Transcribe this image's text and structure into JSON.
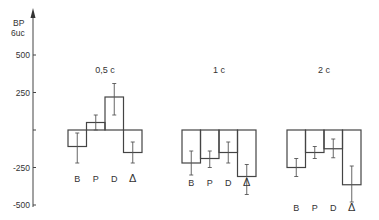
{
  "chart_data": {
    "type": "bar",
    "title": "",
    "ylabel": "BP\n6uc",
    "ylabel_lines": [
      "BP",
      "6uc"
    ],
    "ylim": [
      -500,
      600
    ],
    "yticks": [
      500,
      250,
      0,
      -250,
      -500
    ],
    "ytick_labels": [
      "500",
      "250",
      "",
      "-250",
      "-500"
    ],
    "grid": false,
    "legend": null,
    "categories": [
      "B",
      "P",
      "D",
      "Δ"
    ],
    "groups": [
      {
        "label": "0,5 c",
        "values": [
          -110,
          50,
          220,
          -150
        ],
        "errors": [
          [
            -220,
            -20
          ],
          [
            0,
            100
          ],
          [
            100,
            310
          ],
          [
            -220,
            -80
          ]
        ]
      },
      {
        "label": "1 c",
        "values": [
          -220,
          -190,
          -150,
          -310
        ],
        "errors": [
          [
            -300,
            -140
          ],
          [
            -250,
            -140
          ],
          [
            -220,
            -80
          ],
          [
            -430,
            -230
          ]
        ]
      },
      {
        "label": "2 c",
        "values": [
          -250,
          -150,
          -125,
          -365
        ],
        "errors": [
          [
            -310,
            -190
          ],
          [
            -190,
            -110
          ],
          [
            -185,
            -60
          ],
          [
            -480,
            -240
          ]
        ]
      }
    ]
  }
}
